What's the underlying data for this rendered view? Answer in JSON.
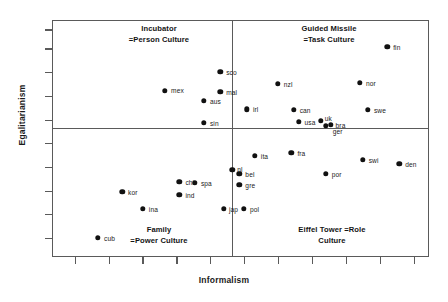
{
  "chart_data": {
    "type": "scatter",
    "title": "",
    "xlabel": "Informalism",
    "ylabel": "Egalitarianism",
    "xlim": [
      0,
      100
    ],
    "ylim": [
      0,
      100
    ],
    "grid": false,
    "legend": "none",
    "axis_tick_labels": {
      "x": [],
      "y": []
    },
    "quadrants": [
      {
        "id": "upper-left",
        "label": "Incubator\n=Person Culture"
      },
      {
        "id": "upper-right",
        "label": "Guided Missile\n=Task Culture"
      },
      {
        "id": "lower-left",
        "label": "Family\n=Power Culture"
      },
      {
        "id": "lower-right",
        "label": "Eiffel Tower =Role\nCulture"
      }
    ],
    "divider_x": 47.8,
    "divider_y": 45.6,
    "points": [
      {
        "label": "fin",
        "x": 88.9,
        "y": 88.6,
        "lx": 6,
        "ly": -3
      },
      {
        "label": "sco",
        "x": 44.6,
        "y": 78.1,
        "lx": 6,
        "ly": -3
      },
      {
        "label": "nor",
        "x": 81.7,
        "y": 73.4,
        "lx": 6,
        "ly": -3
      },
      {
        "label": "nzl",
        "x": 59.9,
        "y": 73.0,
        "lx": 6,
        "ly": -3
      },
      {
        "label": "mex",
        "x": 30.0,
        "y": 70.0,
        "lx": 6,
        "ly": -4
      },
      {
        "label": "mal",
        "x": 44.6,
        "y": 69.6,
        "lx": 6,
        "ly": -3
      },
      {
        "label": "aus",
        "x": 40.3,
        "y": 65.8,
        "lx": 6,
        "ly": -3
      },
      {
        "label": "swe",
        "x": 83.8,
        "y": 62.0,
        "lx": 6,
        "ly": -3
      },
      {
        "label": "irl",
        "x": 51.7,
        "y": 62.4,
        "lx": 6,
        "ly": -3
      },
      {
        "label": "can",
        "x": 64.1,
        "y": 62.0,
        "lx": 6,
        "ly": -3
      },
      {
        "label": "usa",
        "x": 65.4,
        "y": 57.0,
        "lx": 6,
        "ly": -3
      },
      {
        "label": "uk",
        "x": 71.3,
        "y": 57.4,
        "lx": 4,
        "ly": -6
      },
      {
        "label": "bra",
        "x": 73.9,
        "y": 55.7,
        "lx": 5,
        "ly": -3
      },
      {
        "label": "ger",
        "x": 72.6,
        "y": 55.3,
        "lx": 7,
        "ly": 2
      },
      {
        "label": "sin",
        "x": 40.3,
        "y": 56.5,
        "lx": 6,
        "ly": -3
      },
      {
        "label": "fra",
        "x": 63.5,
        "y": 43.9,
        "lx": 6,
        "ly": -3
      },
      {
        "label": "ita",
        "x": 53.8,
        "y": 42.6,
        "lx": 6,
        "ly": -3
      },
      {
        "label": "swi",
        "x": 82.4,
        "y": 40.9,
        "lx": 6,
        "ly": -3
      },
      {
        "label": "den",
        "x": 92.1,
        "y": 39.2,
        "lx": 6,
        "ly": -3
      },
      {
        "label": "nl",
        "x": 47.8,
        "y": 36.7,
        "lx": 5,
        "ly": -4
      },
      {
        "label": "bel",
        "x": 49.7,
        "y": 35.0,
        "lx": 6,
        "ly": -3
      },
      {
        "label": "por",
        "x": 72.6,
        "y": 35.0,
        "lx": 6,
        "ly": -3
      },
      {
        "label": "chi",
        "x": 33.8,
        "y": 31.6,
        "lx": 6,
        "ly": -3
      },
      {
        "label": "spa",
        "x": 37.9,
        "y": 31.2,
        "lx": 6,
        "ly": -3
      },
      {
        "label": "gre",
        "x": 49.7,
        "y": 30.4,
        "lx": 6,
        "ly": -3
      },
      {
        "label": "kor",
        "x": 18.6,
        "y": 27.4,
        "lx": 6,
        "ly": -3
      },
      {
        "label": "ind",
        "x": 33.8,
        "y": 26.2,
        "lx": 6,
        "ly": -3
      },
      {
        "label": "ina",
        "x": 24.1,
        "y": 20.3,
        "lx": 6,
        "ly": -3
      },
      {
        "label": "jap",
        "x": 45.6,
        "y": 20.3,
        "lx": 5,
        "ly": -3
      },
      {
        "label": "pol",
        "x": 50.9,
        "y": 20.3,
        "lx": 6,
        "ly": -3
      },
      {
        "label": "cub",
        "x": 12.2,
        "y": 8.0,
        "lx": 6,
        "ly": -3
      }
    ],
    "y_ticks": [
      8,
      18,
      28,
      38,
      48,
      58,
      68,
      78,
      88,
      96
    ],
    "x_ticks": [
      6,
      15,
      24,
      33,
      42,
      51,
      60,
      69,
      78,
      87,
      96
    ]
  }
}
